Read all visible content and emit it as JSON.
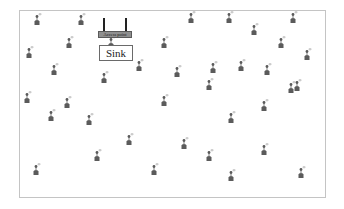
{
  "diagram": {
    "access_point": {
      "label": "Access point"
    },
    "sink": {
      "label": "Sink"
    },
    "node_icon": "sensor-node-icon",
    "colors": {
      "node": "#5b5b5b",
      "frame": "#c4c4c4",
      "access_point_bar": "#8f8f8f"
    },
    "nodes": [
      {
        "x": 38,
        "y": 22
      },
      {
        "x": 82,
        "y": 22
      },
      {
        "x": 192,
        "y": 20
      },
      {
        "x": 230,
        "y": 20
      },
      {
        "x": 294,
        "y": 20
      },
      {
        "x": 70,
        "y": 45
      },
      {
        "x": 112,
        "y": 45
      },
      {
        "x": 165,
        "y": 45
      },
      {
        "x": 255,
        "y": 32
      },
      {
        "x": 282,
        "y": 45
      },
      {
        "x": 30,
        "y": 55
      },
      {
        "x": 308,
        "y": 57
      },
      {
        "x": 55,
        "y": 72
      },
      {
        "x": 105,
        "y": 80
      },
      {
        "x": 140,
        "y": 68
      },
      {
        "x": 178,
        "y": 74
      },
      {
        "x": 214,
        "y": 70
      },
      {
        "x": 242,
        "y": 68
      },
      {
        "x": 268,
        "y": 72
      },
      {
        "x": 298,
        "y": 88
      },
      {
        "x": 28,
        "y": 100
      },
      {
        "x": 68,
        "y": 105
      },
      {
        "x": 52,
        "y": 118
      },
      {
        "x": 90,
        "y": 122
      },
      {
        "x": 165,
        "y": 103
      },
      {
        "x": 210,
        "y": 87
      },
      {
        "x": 265,
        "y": 108
      },
      {
        "x": 232,
        "y": 120
      },
      {
        "x": 292,
        "y": 90
      },
      {
        "x": 130,
        "y": 142
      },
      {
        "x": 185,
        "y": 146
      },
      {
        "x": 265,
        "y": 152
      },
      {
        "x": 210,
        "y": 158
      },
      {
        "x": 98,
        "y": 158
      },
      {
        "x": 37,
        "y": 172
      },
      {
        "x": 155,
        "y": 172
      },
      {
        "x": 232,
        "y": 178
      },
      {
        "x": 302,
        "y": 175
      }
    ]
  }
}
